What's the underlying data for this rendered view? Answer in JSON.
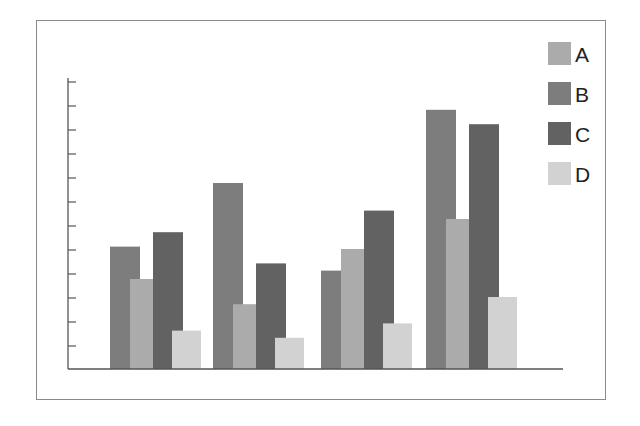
{
  "chart_data": {
    "type": "bar",
    "title": "",
    "xlabel": "",
    "ylabel": "",
    "categories": [
      "",
      "",
      "",
      ""
    ],
    "series": [
      {
        "name": "A",
        "color": "#ababab",
        "values": [
          3.75,
          2.7,
          5.0,
          6.25
        ]
      },
      {
        "name": "B",
        "color": "#7d7d7d",
        "values": [
          5.1,
          7.75,
          4.1,
          10.8
        ]
      },
      {
        "name": "C",
        "color": "#626262",
        "values": [
          5.7,
          4.4,
          6.6,
          10.2
        ]
      },
      {
        "name": "D",
        "color": "#d2d2d2",
        "values": [
          1.6,
          1.3,
          1.9,
          3.0
        ]
      }
    ],
    "ylim": [
      0,
      12
    ],
    "y_ticks": 12,
    "tick_labels_visible": false,
    "grid": false,
    "legend_position": "top-right"
  },
  "legend": {
    "items": [
      {
        "label": "A",
        "color": "#ababab"
      },
      {
        "label": "B",
        "color": "#7d7d7d"
      },
      {
        "label": "C",
        "color": "#626262"
      },
      {
        "label": "D",
        "color": "#d2d2d2"
      }
    ]
  }
}
